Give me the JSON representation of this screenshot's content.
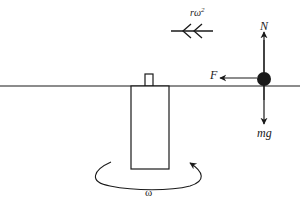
{
  "diagram": {
    "type": "free-body diagram on rotating rod",
    "colors": {
      "stroke": "#1a1a1a",
      "background": "#ffffff"
    },
    "labels": {
      "normal_force": "N",
      "friction_force": "F",
      "weight": "mg",
      "centripetal_base": "rω",
      "centripetal_exp": "2",
      "angular_velocity": "ω"
    },
    "elements": [
      {
        "id": "horizontal-rod",
        "desc": "horizontal line / rod"
      },
      {
        "id": "vertical-shaft",
        "desc": "rectangular rotating shaft"
      },
      {
        "id": "shaft-cap",
        "desc": "small stub on top of shaft"
      },
      {
        "id": "particle",
        "desc": "black mass on rod"
      },
      {
        "id": "arrow-N",
        "direction": "up",
        "label": "N"
      },
      {
        "id": "arrow-F",
        "direction": "left",
        "label": "F"
      },
      {
        "id": "arrow-mg",
        "direction": "down",
        "label": "mg"
      },
      {
        "id": "acceleration-arrow",
        "direction": "left",
        "label": "rω²",
        "style": "double chevron"
      },
      {
        "id": "rotation-arrow",
        "desc": "curved arrow around shaft base",
        "label": "ω"
      }
    ]
  }
}
